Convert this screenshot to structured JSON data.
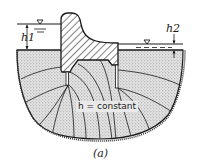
{
  "diagram": {
    "type": "seepage flow net beneath a gravity dam with sheet piles",
    "labels": {
      "upstream_head": "h1",
      "downstream_head": "h2",
      "equipotential": "h = constant",
      "caption": "(a)"
    },
    "symbols": {
      "upstream_water_level": "water-level-triangle-icon",
      "downstream_water_level": "water-level-triangle-icon"
    },
    "colors": {
      "line": "#1a1a1a",
      "soil_fill": "#d9d9d9",
      "background": "#ffffff"
    }
  }
}
